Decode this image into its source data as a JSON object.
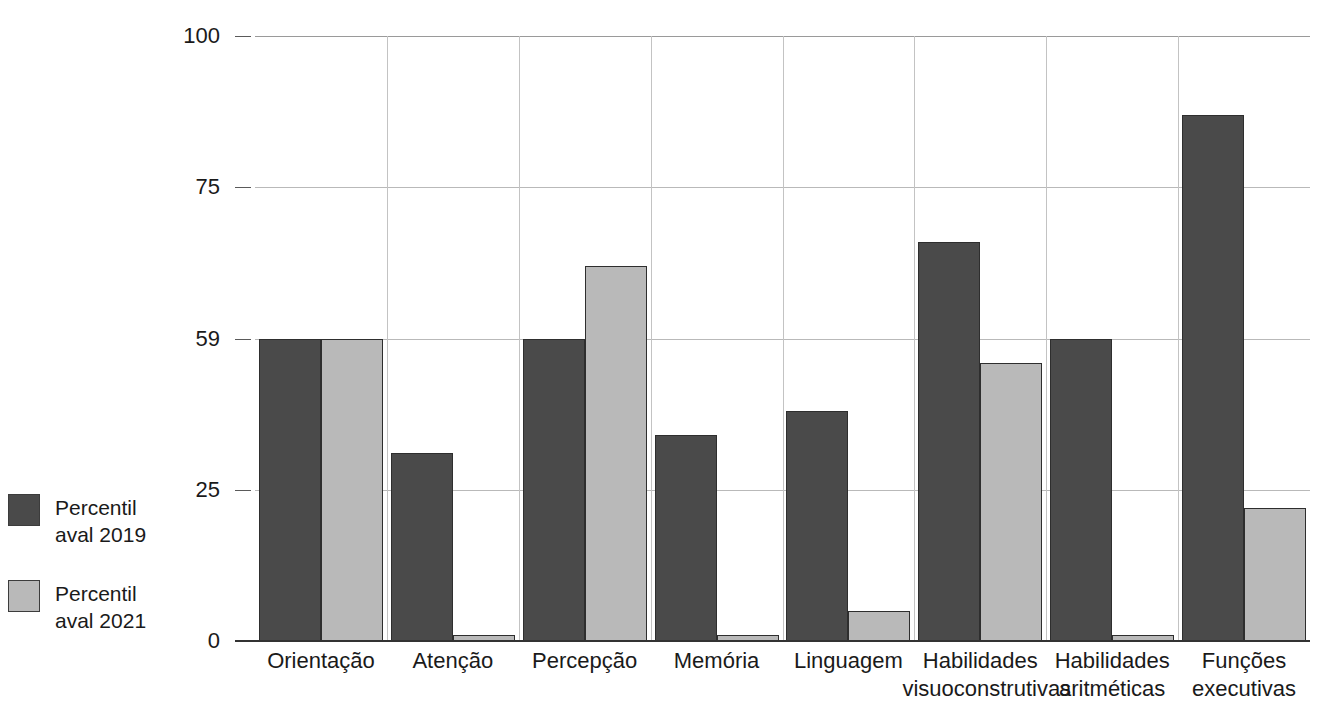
{
  "chart_data": {
    "type": "bar",
    "title": "",
    "subtitle": "",
    "xlabel": "",
    "ylabel": "",
    "ylim": [
      0,
      100
    ],
    "grid": true,
    "legend_position": "left",
    "categories": [
      "Orientação",
      "Atenção",
      "Percepção",
      "Memória",
      "Linguagem",
      "Habilidades\nvisuoconstrutivas",
      "Habilidades\naritméticas",
      "Funções\nexecutivas"
    ],
    "y_ticks": [
      {
        "label": "0",
        "value": 0
      },
      {
        "label": "25",
        "value": 25
      },
      {
        "label": "59",
        "value": 50
      },
      {
        "label": "75",
        "value": 75
      },
      {
        "label": "100",
        "value": 100
      }
    ],
    "series": [
      {
        "name": "Percentil aval 2019",
        "color": "#4a4a4a",
        "values": [
          50,
          31,
          50,
          34,
          38,
          66,
          50,
          87
        ]
      },
      {
        "name": "Percentil aval 2021",
        "color": "#b9b9b9",
        "values": [
          50,
          1,
          62,
          1,
          5,
          46,
          1,
          22
        ]
      }
    ]
  },
  "legend": {
    "items": [
      {
        "label": "Percentil\naval 2019",
        "color": "#4a4a4a"
      },
      {
        "label": "Percentil\naval 2021",
        "color": "#b9b9b9"
      }
    ]
  },
  "colors": {
    "series_2019": "#4a4a4a",
    "series_2021": "#b9b9b9",
    "grid": "#b9b9b9",
    "axis": "#333333",
    "text": "#1a1a1a",
    "background": "#ffffff"
  }
}
